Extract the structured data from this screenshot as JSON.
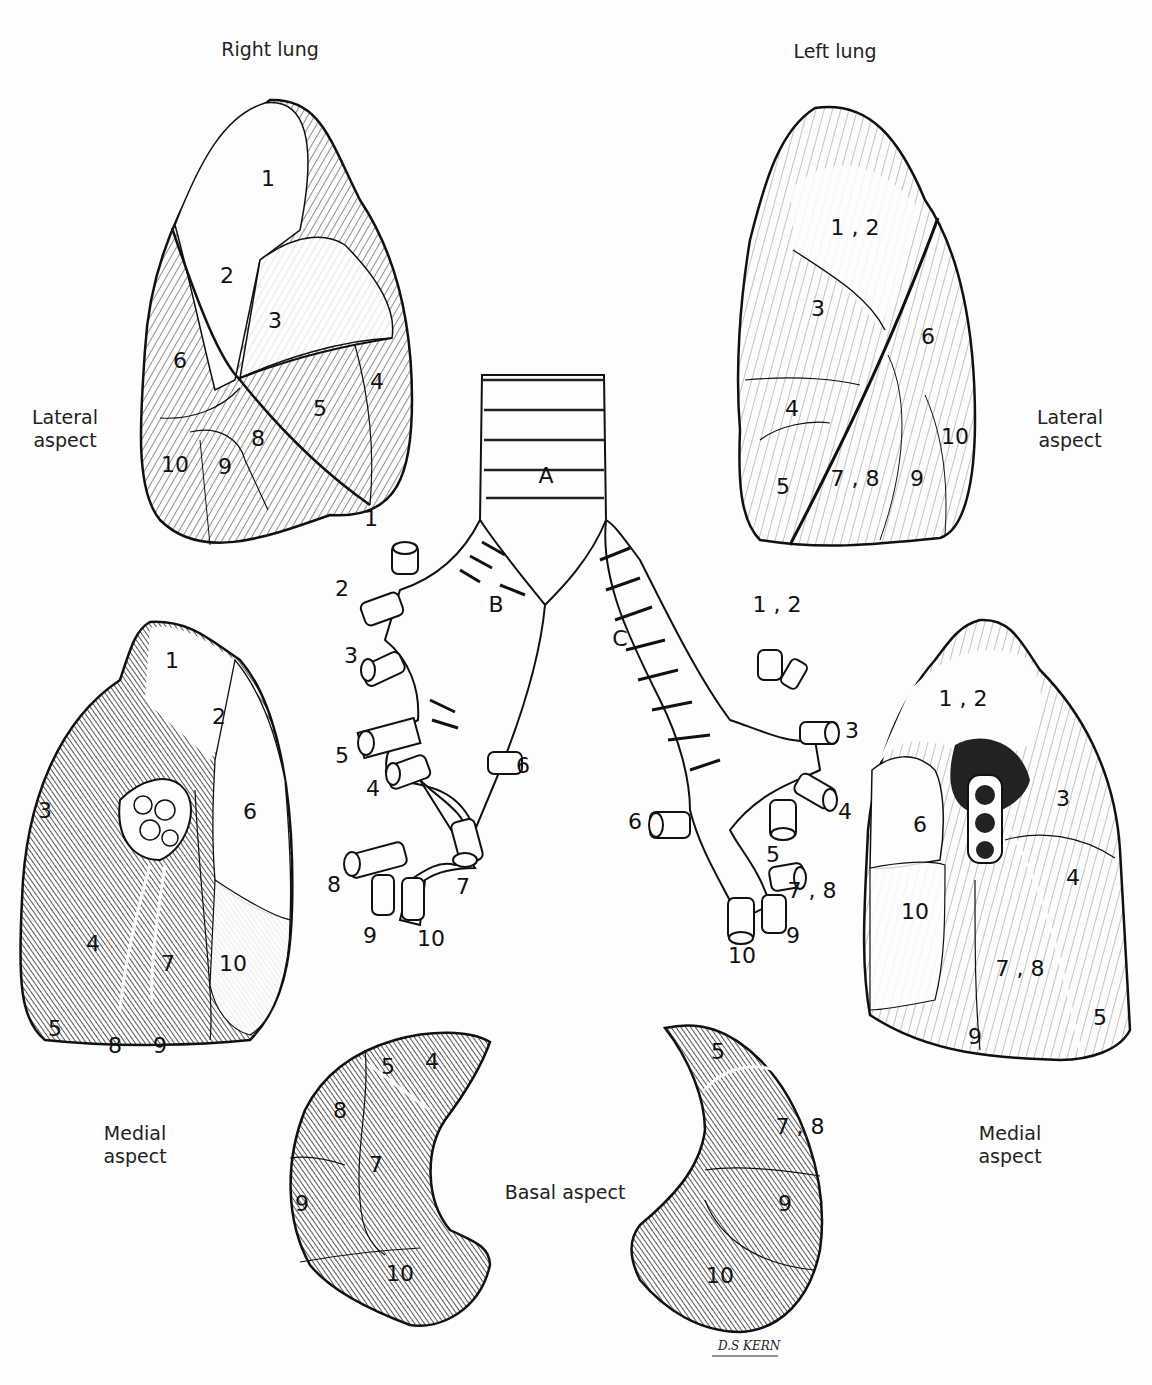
{
  "headings": {
    "right_lung": "Right lung",
    "left_lung": "Left lung"
  },
  "aspects": {
    "lateral_left": [
      "Lateral",
      "aspect"
    ],
    "lateral_right": [
      "Lateral",
      "aspect"
    ],
    "medial_left": [
      "Medial",
      "aspect"
    ],
    "medial_right": [
      "Medial",
      "aspect"
    ],
    "basal": "Basal aspect"
  },
  "right_lateral_segments": [
    {
      "label": "1",
      "x": 268,
      "y": 180
    },
    {
      "label": "2",
      "x": 227,
      "y": 277
    },
    {
      "label": "3",
      "x": 275,
      "y": 322
    },
    {
      "label": "6",
      "x": 180,
      "y": 362
    },
    {
      "label": "4",
      "x": 377,
      "y": 383
    },
    {
      "label": "5",
      "x": 320,
      "y": 410
    },
    {
      "label": "8",
      "x": 258,
      "y": 440
    },
    {
      "label": "9",
      "x": 225,
      "y": 468
    },
    {
      "label": "10",
      "x": 175,
      "y": 466
    }
  ],
  "left_lateral_segments": [
    {
      "label": "1 , 2",
      "x": 855,
      "y": 229
    },
    {
      "label": "3",
      "x": 818,
      "y": 310
    },
    {
      "label": "6",
      "x": 928,
      "y": 338
    },
    {
      "label": "4",
      "x": 792,
      "y": 410
    },
    {
      "label": "10",
      "x": 955,
      "y": 438
    },
    {
      "label": "5",
      "x": 783,
      "y": 488
    },
    {
      "label": "7 , 8",
      "x": 855,
      "y": 480
    },
    {
      "label": "9",
      "x": 917,
      "y": 480
    }
  ],
  "right_medial_segments": [
    {
      "label": "1",
      "x": 172,
      "y": 662
    },
    {
      "label": "2",
      "x": 219,
      "y": 718
    },
    {
      "label": "6",
      "x": 250,
      "y": 813
    },
    {
      "label": "3",
      "x": 45,
      "y": 812
    },
    {
      "label": "4",
      "x": 93,
      "y": 945
    },
    {
      "label": "7",
      "x": 168,
      "y": 965
    },
    {
      "label": "10",
      "x": 233,
      "y": 965
    },
    {
      "label": "8",
      "x": 115,
      "y": 1047
    },
    {
      "label": "9",
      "x": 160,
      "y": 1047
    },
    {
      "label": "5",
      "x": 55,
      "y": 1030
    }
  ],
  "left_medial_segments": [
    {
      "label": "1 , 2",
      "x": 963,
      "y": 700
    },
    {
      "label": "3",
      "x": 1063,
      "y": 800
    },
    {
      "label": "6",
      "x": 920,
      "y": 826
    },
    {
      "label": "4",
      "x": 1073,
      "y": 879
    },
    {
      "label": "10",
      "x": 915,
      "y": 913
    },
    {
      "label": "7 , 8",
      "x": 1020,
      "y": 970
    },
    {
      "label": "5",
      "x": 1100,
      "y": 1019
    },
    {
      "label": "9",
      "x": 975,
      "y": 1038
    }
  ],
  "bronchial_tree": {
    "trachea": "A",
    "right_main_bronchus": "B",
    "left_main_bronchus": "C",
    "right_branches": [
      {
        "label": "1",
        "x": 371,
        "y": 520
      },
      {
        "label": "2",
        "x": 342,
        "y": 590
      },
      {
        "label": "3",
        "x": 351,
        "y": 657
      },
      {
        "label": "5",
        "x": 342,
        "y": 757
      },
      {
        "label": "4",
        "x": 373,
        "y": 790
      },
      {
        "label": "6",
        "x": 523,
        "y": 767
      },
      {
        "label": "8",
        "x": 334,
        "y": 886
      },
      {
        "label": "7",
        "x": 463,
        "y": 888
      },
      {
        "label": "9",
        "x": 370,
        "y": 937
      },
      {
        "label": "10",
        "x": 431,
        "y": 940
      }
    ],
    "left_branches": [
      {
        "label": "1 , 2",
        "x": 777,
        "y": 606
      },
      {
        "label": "3",
        "x": 852,
        "y": 732
      },
      {
        "label": "4",
        "x": 845,
        "y": 813
      },
      {
        "label": "6",
        "x": 635,
        "y": 823
      },
      {
        "label": "5",
        "x": 773,
        "y": 856
      },
      {
        "label": "7 , 8",
        "x": 812,
        "y": 892
      },
      {
        "label": "9",
        "x": 793,
        "y": 937
      },
      {
        "label": "10",
        "x": 742,
        "y": 957
      }
    ]
  },
  "basal_right_segments": [
    {
      "label": "5",
      "x": 388,
      "y": 1068
    },
    {
      "label": "4",
      "x": 432,
      "y": 1063
    },
    {
      "label": "8",
      "x": 340,
      "y": 1112
    },
    {
      "label": "7",
      "x": 376,
      "y": 1166
    },
    {
      "label": "9",
      "x": 302,
      "y": 1205
    },
    {
      "label": "10",
      "x": 400,
      "y": 1275
    }
  ],
  "basal_left_segments": [
    {
      "label": "5",
      "x": 718,
      "y": 1053
    },
    {
      "label": "7 , 8",
      "x": 800,
      "y": 1128
    },
    {
      "label": "9",
      "x": 785,
      "y": 1205
    },
    {
      "label": "10",
      "x": 720,
      "y": 1277
    }
  ],
  "signature": "D.S KERN"
}
